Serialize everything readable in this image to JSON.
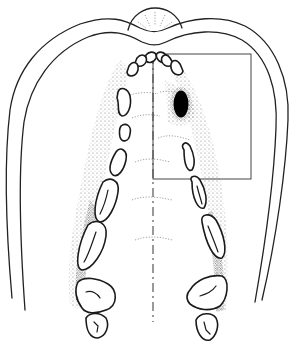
{
  "figure": {
    "colors": {
      "line": "#1a1a1a",
      "lesion": "#000000",
      "background": "#ffffff",
      "stipple": "#444444"
    },
    "elements": {
      "lip_outline": "double outer contour with incisive papilla bulge at top",
      "midline": "dash-dot vertical line at x≈153 from y≈55 to y≈322",
      "highlight_box": {
        "x": 153,
        "y": 54,
        "width": 98,
        "height": 125
      },
      "lesion": {
        "cx": 181,
        "cy": 104,
        "rx": 8,
        "ry": 14
      },
      "teeth_left": [
        "central incisor",
        "lateral incisor",
        "canine",
        "first premolar",
        "second premolar",
        "first molar",
        "second molar",
        "third molar"
      ],
      "teeth_right": [
        "central incisor",
        "lateral incisor",
        "canine",
        "first premolar",
        "second premolar",
        "first molar",
        "second molar",
        "third molar"
      ]
    }
  }
}
